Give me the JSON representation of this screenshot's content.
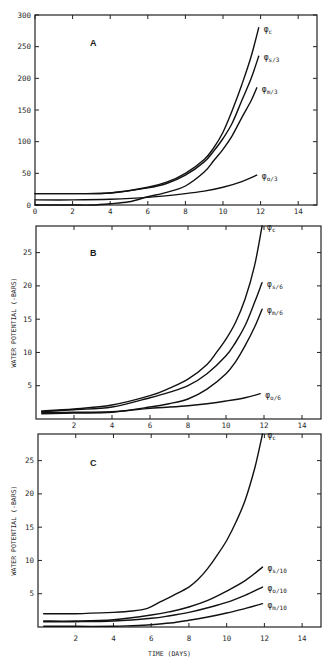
{
  "chart_data": [
    {
      "type": "line",
      "panel": "A",
      "title": "A",
      "xlabel": "",
      "ylabel": "",
      "xlim": [
        0,
        15
      ],
      "ylim": [
        0,
        300
      ],
      "xticks": [
        0,
        2,
        4,
        6,
        8,
        10,
        12,
        14
      ],
      "yticks": [
        0,
        50,
        100,
        150,
        200,
        250,
        300
      ],
      "grid": false,
      "legend_position": "inline-right",
      "series": [
        {
          "name": "φc",
          "label_main": "φ",
          "label_sub": "c",
          "x": [
            0,
            2,
            4,
            6,
            7,
            8,
            9,
            9.5,
            10,
            10.5,
            11,
            11.5,
            11.9
          ],
          "y": [
            18,
            18,
            19,
            28,
            36,
            50,
            72,
            90,
            115,
            150,
            190,
            235,
            280
          ]
        },
        {
          "name": "φs/3",
          "label_main": "φ",
          "label_sub": "s/3",
          "x": [
            0,
            2,
            4,
            6,
            7,
            8,
            9,
            9.5,
            10,
            10.5,
            11,
            11.5,
            11.9
          ],
          "y": [
            18,
            18,
            19,
            27,
            34,
            47,
            68,
            85,
            105,
            130,
            165,
            200,
            235
          ]
        },
        {
          "name": "φm/3",
          "label_main": "φ",
          "label_sub": "m/3",
          "x": [
            0,
            2,
            3,
            4,
            5,
            6,
            7,
            8,
            9,
            9.5,
            10,
            10.5,
            11,
            11.5,
            11.8
          ],
          "y": [
            0,
            0,
            0,
            2,
            5,
            13,
            20,
            30,
            52,
            70,
            88,
            110,
            138,
            165,
            185
          ]
        },
        {
          "name": "φo/3",
          "label_main": "φ",
          "label_sub": "o/3",
          "x": [
            0,
            2,
            4,
            6,
            8,
            9,
            10,
            11,
            11.8
          ],
          "y": [
            8,
            8,
            9,
            12,
            18,
            22,
            28,
            37,
            47
          ]
        }
      ]
    },
    {
      "type": "line",
      "panel": "B",
      "title": "B",
      "xlabel": "",
      "ylabel": "WATER POTENTIAL (-BARS)",
      "xlim": [
        0,
        15
      ],
      "ylim": [
        0,
        29
      ],
      "xticks": [
        2,
        4,
        6,
        8,
        10,
        12,
        14
      ],
      "yticks": [
        5,
        10,
        15,
        20,
        25
      ],
      "grid": false,
      "legend_position": "inline-right",
      "series": [
        {
          "name": "φc",
          "label_main": "φ",
          "label_sub": "c",
          "x": [
            0.3,
            2,
            4,
            6,
            7,
            8,
            9,
            9.5,
            10,
            10.5,
            11,
            11.5,
            11.9
          ],
          "y": [
            1.2,
            1.5,
            2.1,
            3.5,
            4.6,
            6.0,
            8.2,
            10.0,
            12.0,
            14.5,
            18.0,
            23.0,
            29.0
          ]
        },
        {
          "name": "φs/6",
          "label_main": "φ",
          "label_sub": "s/6",
          "x": [
            0.3,
            2,
            4,
            6,
            7,
            8,
            9,
            10,
            10.5,
            11,
            11.5,
            11.9
          ],
          "y": [
            1.1,
            1.4,
            1.8,
            3.2,
            4.0,
            5.0,
            6.8,
            9.5,
            11.5,
            14.0,
            17.5,
            20.5
          ]
        },
        {
          "name": "φm/6",
          "label_main": "φ",
          "label_sub": "m/6",
          "x": [
            0.3,
            2,
            4,
            6,
            7,
            8,
            9,
            10,
            10.5,
            11,
            11.5,
            11.9
          ],
          "y": [
            0.8,
            0.9,
            1.0,
            1.8,
            2.3,
            3.0,
            4.5,
            6.8,
            8.6,
            11.0,
            13.8,
            16.5
          ]
        },
        {
          "name": "φo/6",
          "label_main": "φ",
          "label_sub": "o/6",
          "x": [
            0.3,
            2,
            4,
            6,
            8,
            9,
            10,
            11,
            11.8
          ],
          "y": [
            1.0,
            1.0,
            1.1,
            1.6,
            2.0,
            2.3,
            2.7,
            3.2,
            3.8
          ]
        }
      ]
    },
    {
      "type": "line",
      "panel": "C",
      "title": "C",
      "xlabel": "TIME (DAYS)",
      "ylabel": "WATER POTENTIAL (-BARS)",
      "xlim": [
        0,
        15
      ],
      "ylim": [
        0,
        29
      ],
      "xticks": [
        2,
        4,
        6,
        8,
        10,
        12,
        14
      ],
      "yticks": [
        5,
        10,
        15,
        20,
        25
      ],
      "grid": false,
      "legend_position": "inline-right",
      "series": [
        {
          "name": "φc",
          "label_main": "φ",
          "label_sub": "c",
          "x": [
            0.3,
            2,
            4,
            5,
            5.8,
            6.5,
            7.2,
            8,
            8.5,
            9,
            9.5,
            10,
            10.5,
            11,
            11.5,
            11.9
          ],
          "y": [
            2.0,
            2.0,
            2.2,
            2.4,
            2.8,
            3.8,
            4.8,
            6.0,
            7.2,
            8.8,
            10.8,
            13.0,
            15.8,
            19.2,
            24.0,
            29.0
          ]
        },
        {
          "name": "φs/10",
          "label_main": "φ",
          "label_sub": "s/10",
          "x": [
            0.3,
            2,
            4,
            6,
            7,
            8,
            9,
            10,
            11,
            11.9
          ],
          "y": [
            0.9,
            0.9,
            1.1,
            1.8,
            2.3,
            3.0,
            4.0,
            5.4,
            7.0,
            9.0
          ]
        },
        {
          "name": "φo/10",
          "label_main": "φ",
          "label_sub": "o/10",
          "x": [
            0.3,
            2,
            4,
            6,
            7,
            8,
            9,
            10,
            11,
            11.9
          ],
          "y": [
            0.8,
            0.8,
            0.9,
            1.3,
            1.7,
            2.2,
            2.9,
            3.7,
            4.8,
            6.0
          ]
        },
        {
          "name": "φm/10",
          "label_main": "φ",
          "label_sub": "m/10",
          "x": [
            0.3,
            2,
            4,
            5,
            6,
            7,
            8,
            9,
            10,
            11,
            11.9
          ],
          "y": [
            0.1,
            0.1,
            0.1,
            0.2,
            0.35,
            0.6,
            1.0,
            1.5,
            2.1,
            2.8,
            3.5
          ]
        }
      ]
    }
  ],
  "panels": [
    {
      "id": "A",
      "letter": "A",
      "ylabel": "",
      "xlabel": ""
    },
    {
      "id": "B",
      "letter": "B",
      "ylabel": "WATER POTENTIAL (-BARS)",
      "xlabel": ""
    },
    {
      "id": "C",
      "letter": "C",
      "ylabel": "WATER POTENTIAL (-BARS)",
      "xlabel": "TIME (DAYS)"
    }
  ],
  "colors": {
    "ink": "#111111",
    "frame": "#222222",
    "background": "#ffffff"
  }
}
